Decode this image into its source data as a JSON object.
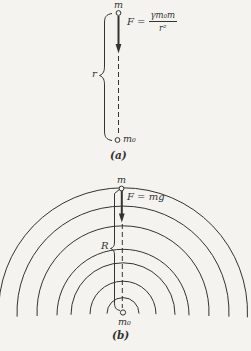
{
  "panel_a": {
    "top_mass": "m",
    "bottom_mass": "m₀",
    "distance_label": "r",
    "formula_lhs": "F =",
    "formula_numerator": "γm₀m",
    "formula_denominator": "r²",
    "caption": "(a)"
  },
  "panel_b": {
    "top_mass": "m",
    "bottom_mass": "m₀",
    "radius_label": "R",
    "force_label": "F = mg",
    "caption": "(b)",
    "arc_center": {
      "x": 123,
      "y": 313
    },
    "arc_radii": [
      16,
      33,
      52,
      66,
      86,
      106,
      124.5
    ]
  },
  "colors": {
    "ink": "#333330",
    "background": "#f4f3ef"
  }
}
